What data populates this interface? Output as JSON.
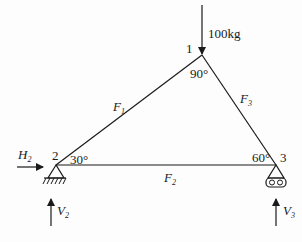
{
  "diagram": {
    "type": "truss",
    "colors": {
      "line": "#1a1a1a",
      "background": "#fdfdfd"
    },
    "nodes": [
      {
        "id": "1",
        "label": "1",
        "angle": "90°",
        "x": 202,
        "y": 55
      },
      {
        "id": "2",
        "label": "2",
        "angle": "30°",
        "x": 56,
        "y": 165
      },
      {
        "id": "3",
        "label": "3",
        "angle": "60°",
        "x": 276,
        "y": 165
      }
    ],
    "members": [
      {
        "id": "F1",
        "name": "F",
        "sub": "1",
        "from": "2",
        "to": "1"
      },
      {
        "id": "F2",
        "name": "F",
        "sub": "2",
        "from": "2",
        "to": "3"
      },
      {
        "id": "F3",
        "name": "F",
        "sub": "3",
        "from": "3",
        "to": "1"
      }
    ],
    "loads": [
      {
        "id": "load",
        "label": "100kg",
        "node": "1",
        "direction": "down"
      }
    ],
    "reactions": [
      {
        "id": "H2",
        "name": "H",
        "sub": "2",
        "node": "2",
        "direction": "right"
      },
      {
        "id": "V2",
        "name": "V",
        "sub": "2",
        "node": "2",
        "direction": "up"
      },
      {
        "id": "V3",
        "name": "V",
        "sub": "3",
        "node": "3",
        "direction": "up"
      }
    ],
    "supports": [
      {
        "node": "2",
        "type": "pin"
      },
      {
        "node": "3",
        "type": "roller"
      }
    ]
  }
}
